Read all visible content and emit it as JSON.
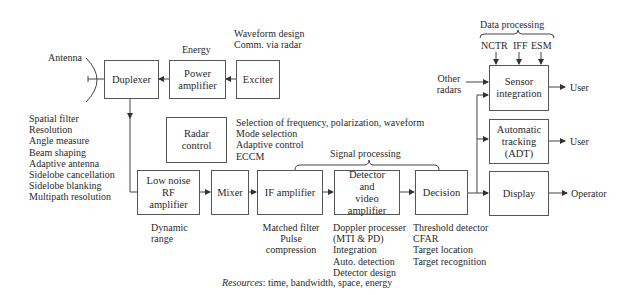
{
  "blocks": {
    "duplexer": "Duplexer",
    "power_amplifier": "Power\namplifier",
    "exciter": "Exciter",
    "radar_control": "Radar\ncontrol",
    "lna": "Low noise\nRF\namplifier",
    "mixer": "Mixer",
    "if_amplifier": "IF amplifier",
    "detector": "Detector\nand\nvideo amplifier",
    "decision": "Decision",
    "sensor_integration": "Sensor\nintegration",
    "adt": "Automatic\ntracking\n(ADT)",
    "display": "Display"
  },
  "labels": {
    "antenna": "Antenna",
    "energy": "Energy",
    "waveform": "Waveform design\nComm. via radar",
    "antenna_functions": "Spatial filter\nResolution\nAngle measure\nBeam shaping\nAdaptive antenna\nSidelobe cancellation\nSidelobe blanking\nMultipath resolution",
    "control_functions": "Selection of frequency, polarization, waveform\nMode selection\nAdaptive control\nECCM",
    "signal_processing": "Signal processing",
    "dynamic_range": "Dynamic\nrange",
    "if_notes": "Matched filter\nPulse compression",
    "detector_notes": "Doppler processer\n   (MTI & PD)\nIntegration\nAuto. detection\nDetector design",
    "decision_notes": "Threshold detector\nCFAR\nTarget location\nTarget recognition",
    "data_processing": "Data processing",
    "nctr": "NCTR",
    "iff": "IFF",
    "esm": "ESM",
    "other_radars": "Other\nradars",
    "user1": "User",
    "user2": "User",
    "operator": "Operator",
    "resources_label": "Resources",
    "resources_text": ": time, bandwidth, space, energy"
  }
}
